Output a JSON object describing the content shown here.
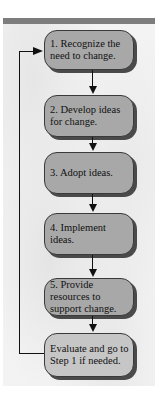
{
  "diagram": {
    "type": "flowchart",
    "steps": [
      {
        "label": "1. Recognize the\n    need to change."
      },
      {
        "label": "2. Develop ideas\n    for change."
      },
      {
        "label": "3. Adopt ideas."
      },
      {
        "label": "4. Implement\n    ideas."
      },
      {
        "label": "5. Provide\n    resources to\n    support change."
      },
      {
        "label": "Evaluate and go to\nStep 1 if needed."
      }
    ],
    "feedback_loop": {
      "from": "Evaluate and go to Step 1 if needed.",
      "to": "1. Recognize the need to change."
    },
    "colors": {
      "box_fill": "#a8a8a8",
      "evaluate_fill": "#c6c6c6",
      "shadow": "#4a4a4a",
      "top_bar": "#7d7d7d",
      "background": "#f3f3f3"
    }
  }
}
